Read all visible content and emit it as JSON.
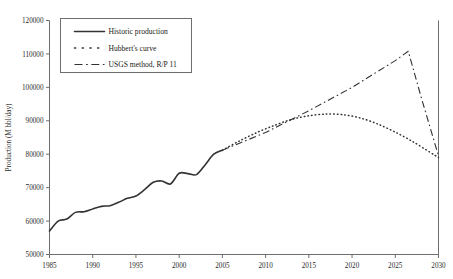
{
  "chart_data": {
    "type": "line",
    "title": "",
    "xlabel": "",
    "ylabel": "Production (M bbl/day)",
    "xlim": [
      1985,
      2030
    ],
    "ylim": [
      50000,
      120000
    ],
    "xticks": [
      "1985",
      "1990",
      "1995",
      "2000",
      "2005",
      "2010",
      "2015",
      "2020",
      "2025",
      "2030"
    ],
    "yticks": [
      "50000",
      "60000",
      "70000",
      "80000",
      "90000",
      "100000",
      "110000",
      "120000"
    ],
    "grid": false,
    "legend_position": "top-left",
    "series": [
      {
        "name": "Historic production",
        "style": "solid",
        "x": [
          1985,
          1986,
          1987,
          1988,
          1989,
          1990,
          1991,
          1992,
          1993,
          1994,
          1995,
          1996,
          1997,
          1998,
          1999,
          2000,
          2001,
          2002,
          2003,
          2004,
          2005
        ],
        "values": [
          57000,
          60000,
          60600,
          62600,
          62800,
          63600,
          64400,
          64600,
          65600,
          66800,
          67500,
          69400,
          71600,
          72000,
          71100,
          74300,
          74200,
          73900,
          76800,
          80000,
          81200
        ]
      },
      {
        "name": "Hubbert's curve",
        "style": "dotted",
        "x": [
          2005,
          2007,
          2009,
          2011,
          2013,
          2015,
          2017,
          2019,
          2021,
          2023,
          2025,
          2027,
          2029,
          2030
        ],
        "values": [
          81200,
          84000,
          86500,
          88600,
          90400,
          91500,
          92000,
          91800,
          90800,
          89000,
          86600,
          83800,
          80600,
          79000
        ]
      },
      {
        "name": "USGS method, R/P 11",
        "style": "dash-dot",
        "x": [
          2005,
          2010,
          2015,
          2020,
          2025,
          2026.5,
          2028,
          2030
        ],
        "values": [
          81200,
          86500,
          93000,
          100000,
          108000,
          110800,
          97000,
          79500
        ]
      }
    ]
  },
  "legend": {
    "items": [
      {
        "label": "Historic production",
        "style": "solid"
      },
      {
        "label": "Hubbert's curve",
        "style": "dotted"
      },
      {
        "label": "USGS method, R/P 11",
        "style": "dash-dot"
      }
    ]
  }
}
